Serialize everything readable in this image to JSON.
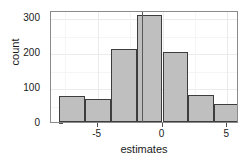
{
  "chart_data": {
    "type": "bar",
    "subtype": "histogram",
    "title": "",
    "xlabel": "estimates",
    "ylabel": "count",
    "xlim": [
      -8.6,
      5.9
    ],
    "ylim": [
      0,
      320
    ],
    "xticks": [
      -5,
      0,
      5
    ],
    "xtick_labels": [
      "-5",
      "0",
      "5"
    ],
    "yticks": [
      0,
      100,
      200,
      300
    ],
    "ytick_labels": [
      "0",
      "100",
      "200",
      "300"
    ],
    "grid": true,
    "legend": false,
    "binwidth": 2,
    "bins": [
      {
        "x0": -8.0,
        "x1": -6.0,
        "center": -7.0,
        "count": 75
      },
      {
        "x0": -6.0,
        "x1": -4.0,
        "center": -5.0,
        "count": 66
      },
      {
        "x0": -4.0,
        "x1": -2.0,
        "center": -3.0,
        "count": 208
      },
      {
        "x0": -2.0,
        "x1": 0.0,
        "center": -1.0,
        "count": 305
      },
      {
        "x0": 0.0,
        "x1": 2.0,
        "center": 1.0,
        "count": 200
      },
      {
        "x0": 2.0,
        "x1": 4.0,
        "center": 3.0,
        "count": 77
      },
      {
        "x0": 4.0,
        "x1": 6.0,
        "center": 5.0,
        "count": 52
      }
    ],
    "categories": [
      "-7",
      "-5",
      "-3",
      "-1",
      "1",
      "3",
      "5"
    ],
    "values": [
      75,
      66,
      208,
      305,
      200,
      77,
      52
    ],
    "annotations": [
      {
        "type": "vertical-line",
        "x": -1.6,
        "label": ""
      }
    ],
    "colors": {
      "bar_fill": "#bfbfbf",
      "bar_stroke": "#3d3d3d",
      "vline": "#595959",
      "panel_border": "#8a8a8a",
      "gridline_major": "#ebebeb",
      "gridline_minor": "#f5f5f5",
      "text": "#1a1a1a",
      "background": "#ffffff"
    }
  }
}
